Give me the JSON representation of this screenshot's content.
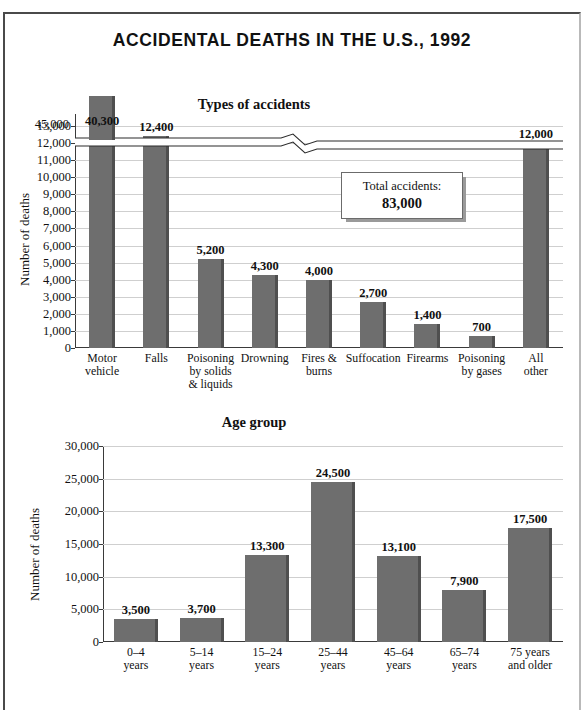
{
  "figure": {
    "title": "ACCIDENTAL DEATHS IN THE U.S., 1992",
    "border_color": "#4a4a4a",
    "bar_color": "#6e6e6e",
    "grid_color": "#cfcfcf"
  },
  "callout": {
    "label": "Total accidents:",
    "value": "83,000"
  },
  "chart_data": [
    {
      "type": "bar",
      "title": "Types of accidents",
      "xlabel": "",
      "ylabel": "Number of deaths",
      "categories": [
        "Motor\nvehicle",
        "Falls",
        "Poisoning\nby solids\n& liquids",
        "Drowning",
        "Fires &\nburns",
        "Suffocation",
        "Firearms",
        "Poisoning\nby gases",
        "All\nother"
      ],
      "values": [
        40300,
        12400,
        5200,
        4300,
        4000,
        2700,
        1400,
        700,
        12000
      ],
      "value_labels": [
        "40,300",
        "12,400",
        "5,200",
        "4,300",
        "4,000",
        "2,700",
        "1,400",
        "700",
        "12,000"
      ],
      "yticks": [
        0,
        1000,
        2000,
        3000,
        4000,
        5000,
        6000,
        7000,
        8000,
        9000,
        10000,
        11000,
        12000,
        13000,
        45000
      ],
      "ytick_labels": [
        "0",
        "1,000",
        "2,000",
        "3,000",
        "4,000",
        "5,000",
        "6,000",
        "7,000",
        "8,000",
        "9,000",
        "10,000",
        "11,000",
        "12,000",
        "13,000",
        "45,000"
      ],
      "ylim": [
        0,
        13000
      ],
      "axis_break": true,
      "axis_break_note": "y-axis broken between 13,000 and 45,000",
      "grid": true,
      "legend": "none"
    },
    {
      "type": "bar",
      "title": "Age group",
      "xlabel": "",
      "ylabel": "Number of deaths",
      "categories": [
        "0–4\nyears",
        "5–14\nyears",
        "15–24\nyears",
        "25–44\nyears",
        "45–64\nyears",
        "65–74\nyears",
        "75 years\nand older"
      ],
      "values": [
        3500,
        3700,
        13300,
        24500,
        13100,
        7900,
        17500
      ],
      "value_labels": [
        "3,500",
        "3,700",
        "13,300",
        "24,500",
        "13,100",
        "7,900",
        "17,500"
      ],
      "yticks": [
        0,
        5000,
        10000,
        15000,
        20000,
        25000,
        30000
      ],
      "ytick_labels": [
        "0",
        "5,000",
        "10,000",
        "15,000",
        "20,000",
        "25,000",
        "30,000"
      ],
      "ylim": [
        0,
        30000
      ],
      "grid": true,
      "legend": "none"
    }
  ]
}
